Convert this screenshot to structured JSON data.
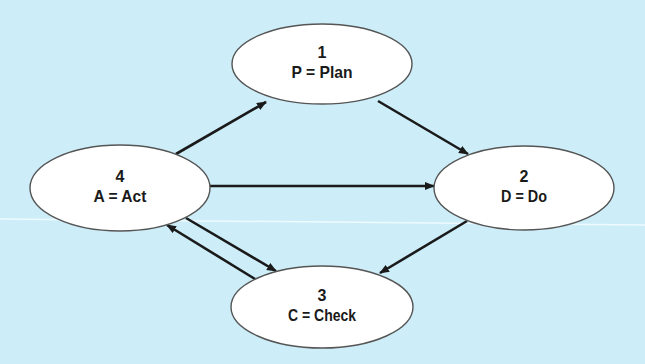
{
  "diagram": {
    "background_color": "#cdeef9",
    "node_fill": "#ffffff",
    "node_stroke": "#555555",
    "arrow_color": "#1a1a1a",
    "nodes": [
      {
        "id": "plan",
        "number": "1",
        "label": "P = Plan",
        "cx": 322,
        "cy": 64,
        "rx": 90,
        "ry": 40
      },
      {
        "id": "do",
        "number": "2",
        "label": "D = Do",
        "cx": 524,
        "cy": 188,
        "rx": 90,
        "ry": 42
      },
      {
        "id": "check",
        "number": "3",
        "label": "C = Check",
        "cx": 322,
        "cy": 307,
        "rx": 91,
        "ry": 41
      },
      {
        "id": "act",
        "number": "4",
        "label": "A = Act",
        "cx": 120,
        "cy": 188,
        "rx": 90,
        "ry": 43
      }
    ],
    "edges": [
      {
        "from": "act",
        "to": "plan",
        "x1": 176,
        "y1": 154,
        "x2": 266,
        "y2": 102
      },
      {
        "from": "plan",
        "to": "do",
        "x1": 378,
        "y1": 101,
        "x2": 468,
        "y2": 154
      },
      {
        "from": "act",
        "to": "do",
        "x1": 210,
        "y1": 186,
        "x2": 434,
        "y2": 186
      },
      {
        "from": "do",
        "to": "check",
        "x1": 467,
        "y1": 221,
        "x2": 380,
        "y2": 273
      },
      {
        "from": "act",
        "to": "check",
        "x1": 186,
        "y1": 218,
        "x2": 276,
        "y2": 271
      },
      {
        "from": "check",
        "to": "act",
        "x1": 255,
        "y1": 279,
        "x2": 167,
        "y2": 225
      }
    ]
  }
}
